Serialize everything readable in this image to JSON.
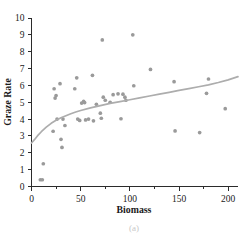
{
  "chart_data": {
    "type": "scatter",
    "title": "",
    "xlabel": "Biomass",
    "ylabel": "Graze Rate",
    "xlim": [
      0,
      210
    ],
    "ylim": [
      0,
      10
    ],
    "grid": false,
    "legend": null,
    "xticks": [
      0,
      50,
      100,
      150,
      200
    ],
    "xtick_labels": [
      "0",
      "50",
      "100",
      "150",
      "200"
    ],
    "xminor_ticks": [
      25,
      75,
      125,
      175
    ],
    "yticks": [
      0,
      1,
      2,
      3,
      4,
      5,
      6,
      7,
      8,
      9,
      10
    ],
    "ytick_labels": [
      "0",
      "1",
      "2",
      "3",
      "4",
      "5",
      "6",
      "7",
      "8",
      "9",
      "10"
    ],
    "point_color": "#9a9a9a",
    "curve_color": "#adadad",
    "points": [
      {
        "x": 9,
        "y": 0.4
      },
      {
        "x": 11,
        "y": 0.4
      },
      {
        "x": 12,
        "y": 1.35
      },
      {
        "x": 22,
        "y": 3.28
      },
      {
        "x": 23,
        "y": 5.8
      },
      {
        "x": 24,
        "y": 5.25
      },
      {
        "x": 25,
        "y": 5.4
      },
      {
        "x": 26,
        "y": 4.0
      },
      {
        "x": 29,
        "y": 6.1
      },
      {
        "x": 30,
        "y": 2.8
      },
      {
        "x": 31,
        "y": 2.32
      },
      {
        "x": 32,
        "y": 4.0
      },
      {
        "x": 34,
        "y": 3.62
      },
      {
        "x": 44,
        "y": 5.8
      },
      {
        "x": 46,
        "y": 6.45
      },
      {
        "x": 47,
        "y": 4.0
      },
      {
        "x": 49,
        "y": 3.92
      },
      {
        "x": 51,
        "y": 4.95
      },
      {
        "x": 53,
        "y": 5.05
      },
      {
        "x": 54,
        "y": 4.98
      },
      {
        "x": 55,
        "y": 3.95
      },
      {
        "x": 58,
        "y": 4.0
      },
      {
        "x": 62,
        "y": 6.6
      },
      {
        "x": 63,
        "y": 3.9
      },
      {
        "x": 66,
        "y": 4.88
      },
      {
        "x": 70,
        "y": 4.35
      },
      {
        "x": 71,
        "y": 4.05
      },
      {
        "x": 72,
        "y": 8.7
      },
      {
        "x": 73,
        "y": 5.3
      },
      {
        "x": 75,
        "y": 5.12
      },
      {
        "x": 80,
        "y": 5.0
      },
      {
        "x": 83,
        "y": 5.45
      },
      {
        "x": 88,
        "y": 5.5
      },
      {
        "x": 91,
        "y": 4.02
      },
      {
        "x": 93,
        "y": 5.48
      },
      {
        "x": 95,
        "y": 5.3
      },
      {
        "x": 96,
        "y": 5.12
      },
      {
        "x": 103,
        "y": 9.0
      },
      {
        "x": 104,
        "y": 5.98
      },
      {
        "x": 121,
        "y": 6.95
      },
      {
        "x": 145,
        "y": 6.22
      },
      {
        "x": 146,
        "y": 3.3
      },
      {
        "x": 171,
        "y": 3.2
      },
      {
        "x": 178,
        "y": 5.53
      },
      {
        "x": 180,
        "y": 6.38
      },
      {
        "x": 197,
        "y": 4.62
      }
    ],
    "fit_curve": {
      "label": "fitted curve",
      "x": [
        0,
        3,
        6,
        10,
        15,
        20,
        25,
        30,
        35,
        40,
        45,
        50,
        60,
        70,
        80,
        90,
        100,
        110,
        120,
        130,
        140,
        150,
        160,
        170,
        180,
        190,
        200,
        210
      ],
      "y": [
        2.58,
        2.78,
        3.0,
        3.25,
        3.52,
        3.75,
        3.93,
        4.08,
        4.2,
        4.32,
        4.42,
        4.51,
        4.67,
        4.8,
        4.93,
        5.04,
        5.15,
        5.26,
        5.37,
        5.48,
        5.59,
        5.7,
        5.81,
        5.92,
        6.03,
        6.17,
        6.33,
        6.52
      ]
    }
  },
  "caption": {
    "text": "(a)"
  }
}
